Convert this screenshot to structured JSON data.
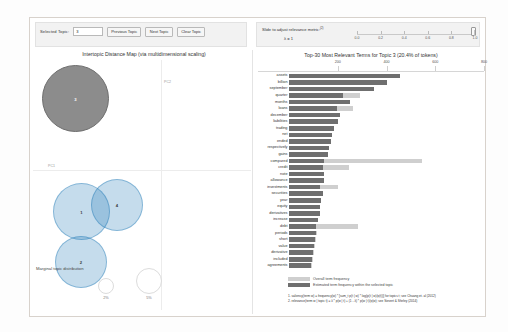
{
  "controls": {
    "selected_topic_label": "Selected Topic:",
    "selected_topic_value": "3",
    "previous_topic_label": "Previous Topic",
    "next_topic_label": "Next Topic",
    "clear_topic_label": "Clear Topic"
  },
  "relevance": {
    "title": "Slide to adjust relevance metric:",
    "superscript": "(2)",
    "lambda_label": "λ = 1",
    "ticks": [
      "0.0",
      "0.2",
      "0.4",
      "0.6",
      "0.8",
      "1.0"
    ],
    "handle_value": "1.0"
  },
  "map": {
    "title": "Intertopic Distance Map (via multidimensional scaling)",
    "axis_x_label": "PC1",
    "axis_y_label": "PC2",
    "marginal_label": "Marginal topic distribution",
    "marginal_sizes": [
      "2%",
      "5%"
    ],
    "topics": [
      {
        "id": "3",
        "selected": true
      },
      {
        "id": "1",
        "selected": false
      },
      {
        "id": "2",
        "selected": false
      },
      {
        "id": "4",
        "selected": false
      }
    ]
  },
  "legend": {
    "overall_label": "Overall term frequency",
    "topic_label": "Estimated term frequency within the selected topic"
  },
  "formulas": {
    "line1": "1. saliency(term w) = frequency(w) * [sum_t p(t | w) * log(p(t | w)/p(t))] for topics t; see Chuang et. al (2012)",
    "line2": "2. relevance(term w | topic t) = λ * p(w | t) + (1 - λ) * p(w | t)/p(w); see Sievert & Shirley (2014)"
  },
  "chart_data": {
    "type": "bar",
    "title": "Top-30 Most Relevant Terms for Topic 3 (20.4% of tokens)",
    "xlabel": "",
    "ylabel": "",
    "xlim": [
      0,
      800
    ],
    "xticks": [
      200,
      400,
      600,
      800
    ],
    "grid": false,
    "legend_position": "bottom",
    "categories": [
      "assets",
      "billion",
      "september",
      "quarter",
      "months",
      "loans",
      "december",
      "liabilities",
      "trading",
      "net",
      "ended",
      "respectively",
      "gains",
      "compared",
      "credit",
      "note",
      "allowance",
      "investments",
      "securities",
      "year",
      "equity",
      "derivatives",
      "increase",
      "debt",
      "periods",
      "short",
      "value",
      "derivative",
      "included",
      "agreements"
    ],
    "series": [
      {
        "name": "Overall term frequency",
        "values": [
          455,
          400,
          350,
          290,
          250,
          262,
          210,
          200,
          185,
          178,
          172,
          163,
          160,
          545,
          248,
          145,
          142,
          202,
          140,
          132,
          128,
          128,
          120,
          282,
          115,
          112,
          108,
          104,
          100,
          96
        ]
      },
      {
        "name": "Estimated term frequency within the selected topic",
        "values": [
          455,
          400,
          350,
          222,
          250,
          196,
          210,
          200,
          185,
          178,
          172,
          163,
          160,
          145,
          140,
          145,
          142,
          126,
          140,
          132,
          128,
          128,
          120,
          112,
          110,
          108,
          104,
          100,
          96,
          92
        ]
      }
    ]
  }
}
